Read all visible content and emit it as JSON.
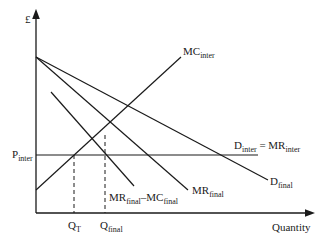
{
  "diagram": {
    "y_axis_label": "£",
    "x_axis_label": "Quantity",
    "curves": {
      "mc_inter": {
        "main": "MC",
        "sub": "inter"
      },
      "d_inter": {
        "main": "D",
        "sub": "inter",
        "eq": " = MR",
        "sub2": "inter"
      },
      "mr_final": {
        "main": "MR",
        "sub": "final"
      },
      "d_final": {
        "main": "D",
        "sub": "final"
      },
      "mr_minus_mc": {
        "main": "MR",
        "sub": "final",
        "mid": "–MC",
        "sub2": "final"
      }
    },
    "price_label": {
      "main": "P",
      "sub": "inter"
    },
    "quantity_labels": {
      "qt": {
        "main": "Q",
        "sub": "T"
      },
      "qfinal": {
        "main": "Q",
        "sub": "final"
      }
    },
    "line_color": "#1a1a1a"
  }
}
